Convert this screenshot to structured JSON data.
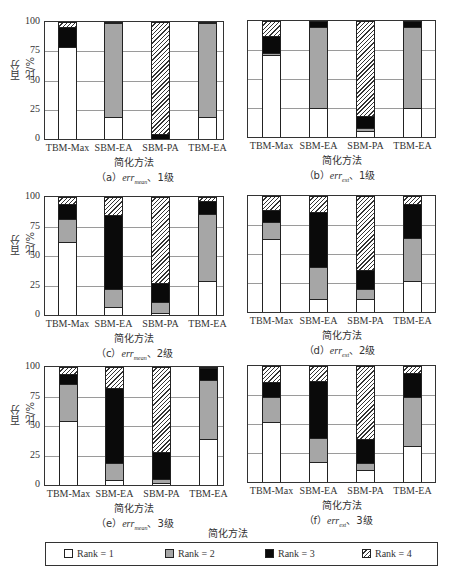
{
  "figure": {
    "y_axis_label": "百分比/%",
    "x_axis_label": "简化方法",
    "y_ticks": [
      "0",
      "25",
      "50",
      "75",
      "100"
    ],
    "categories": [
      "TBM-Max",
      "SBM-EA",
      "SBM-PA",
      "TBM-EA"
    ],
    "bottom_x_label": "简化方法"
  },
  "legend": {
    "items": [
      {
        "label": "Rank = 1",
        "color": "#ffffff"
      },
      {
        "label": "Rank = 2",
        "color": "#a6a6a6"
      },
      {
        "label": "Rank = 3",
        "color": "#0a0a0a"
      },
      {
        "label": "Rank = 4",
        "color": "hatched"
      }
    ]
  },
  "captions": {
    "a": {
      "prefix": "（a）",
      "var": "err",
      "sub": "mean",
      "suffix": "、1级"
    },
    "b": {
      "prefix": "（b）",
      "var": "err",
      "sub": "ext",
      "suffix": "、1级"
    },
    "c": {
      "prefix": "（c）",
      "var": "err",
      "sub": "mean",
      "suffix": "、2级"
    },
    "d": {
      "prefix": "（d）",
      "var": "err",
      "sub": "ext",
      "suffix": "、2级"
    },
    "e": {
      "prefix": "（e）",
      "var": "err",
      "sub": "mean",
      "suffix": "、3级"
    },
    "f": {
      "prefix": "（f）",
      "var": "err",
      "sub": "ext",
      "suffix": "、3级"
    }
  },
  "chart_data": [
    {
      "id": "a",
      "type": "bar",
      "stacked": true,
      "title": "(a) err_mean, 1级",
      "xlabel": "简化方法",
      "ylabel": "百分比/%",
      "ylim": [
        0,
        100
      ],
      "grid": true,
      "categories": [
        "TBM-Max",
        "SBM-EA",
        "SBM-PA",
        "TBM-EA"
      ],
      "series": [
        {
          "name": "Rank = 1",
          "values": [
            79,
            19,
            0,
            19
          ]
        },
        {
          "name": "Rank = 2",
          "values": [
            0,
            80,
            0,
            80
          ]
        },
        {
          "name": "Rank = 3",
          "values": [
            17,
            1,
            4,
            1
          ]
        },
        {
          "name": "Rank = 4",
          "values": [
            4,
            0,
            96,
            0
          ]
        }
      ]
    },
    {
      "id": "b",
      "type": "bar",
      "stacked": true,
      "title": "(b) err_ext, 1级",
      "xlabel": "简化方法",
      "ylabel": "百分比/%",
      "ylim": [
        0,
        100
      ],
      "grid": true,
      "categories": [
        "TBM-Max",
        "SBM-EA",
        "SBM-PA",
        "TBM-EA"
      ],
      "series": [
        {
          "name": "Rank = 1",
          "values": [
            71,
            25,
            5,
            25
          ]
        },
        {
          "name": "Rank = 2",
          "values": [
            1,
            70,
            3,
            70
          ]
        },
        {
          "name": "Rank = 3",
          "values": [
            15,
            5,
            10,
            5
          ]
        },
        {
          "name": "Rank = 4",
          "values": [
            13,
            0,
            82,
            0
          ]
        }
      ]
    },
    {
      "id": "c",
      "type": "bar",
      "stacked": true,
      "title": "(c) err_mean, 2级",
      "xlabel": "简化方法",
      "ylabel": "百分比/%",
      "ylim": [
        0,
        100
      ],
      "grid": true,
      "categories": [
        "TBM-Max",
        "SBM-EA",
        "SBM-PA",
        "TBM-EA"
      ],
      "series": [
        {
          "name": "Rank = 1",
          "values": [
            62,
            7,
            2,
            29
          ]
        },
        {
          "name": "Rank = 2",
          "values": [
            19,
            15,
            9,
            57
          ]
        },
        {
          "name": "Rank = 3",
          "values": [
            13,
            63,
            16,
            11
          ]
        },
        {
          "name": "Rank = 4",
          "values": [
            6,
            15,
            73,
            3
          ]
        }
      ]
    },
    {
      "id": "d",
      "type": "bar",
      "stacked": true,
      "title": "(d) err_ext, 2级",
      "xlabel": "简化方法",
      "ylabel": "百分比/%",
      "ylim": [
        0,
        100
      ],
      "grid": true,
      "categories": [
        "TBM-Max",
        "SBM-EA",
        "SBM-PA",
        "TBM-EA"
      ],
      "series": [
        {
          "name": "Rank = 1",
          "values": [
            63,
            11,
            11,
            27
          ]
        },
        {
          "name": "Rank = 2",
          "values": [
            15,
            28,
            9,
            37
          ]
        },
        {
          "name": "Rank = 3",
          "values": [
            10,
            47,
            16,
            29
          ]
        },
        {
          "name": "Rank = 4",
          "values": [
            12,
            14,
            64,
            7
          ]
        }
      ]
    },
    {
      "id": "e",
      "type": "bar",
      "stacked": true,
      "title": "(e) err_mean, 3级",
      "xlabel": "简化方法",
      "ylabel": "百分比/%",
      "ylim": [
        0,
        100
      ],
      "grid": true,
      "categories": [
        "TBM-Max",
        "SBM-EA",
        "SBM-PA",
        "TBM-EA"
      ],
      "series": [
        {
          "name": "Rank = 1",
          "values": [
            54,
            4,
            2,
            39
          ]
        },
        {
          "name": "Rank = 2",
          "values": [
            32,
            15,
            3,
            50
          ]
        },
        {
          "name": "Rank = 3",
          "values": [
            8,
            63,
            23,
            10
          ]
        },
        {
          "name": "Rank = 4",
          "values": [
            6,
            18,
            72,
            1
          ]
        }
      ]
    },
    {
      "id": "f",
      "type": "bar",
      "stacked": true,
      "title": "(f) err_ext, 3级",
      "xlabel": "简化方法",
      "ylabel": "百分比/%",
      "ylim": [
        0,
        100
      ],
      "grid": true,
      "categories": [
        "TBM-Max",
        "SBM-EA",
        "SBM-PA",
        "TBM-EA"
      ],
      "series": [
        {
          "name": "Rank = 1",
          "values": [
            52,
            17,
            10,
            31
          ]
        },
        {
          "name": "Rank = 2",
          "values": [
            21,
            21,
            6,
            42
          ]
        },
        {
          "name": "Rank = 3",
          "values": [
            13,
            49,
            21,
            21
          ]
        },
        {
          "name": "Rank = 4",
          "values": [
            14,
            13,
            63,
            6
          ]
        }
      ]
    }
  ],
  "layout": {
    "panels": [
      {
        "id": "a",
        "plot": [
          44,
          21,
          180,
          119
        ],
        "bars": [
          58,
          104,
          151,
          198
        ],
        "bar_w": 19,
        "yaxis": true,
        "xlabel_y": 152,
        "caption_y": 168,
        "caption_x": 118
      },
      {
        "id": "b",
        "plot": [
          247,
          20,
          189,
          118
        ],
        "bars": [
          262,
          309,
          356,
          403
        ],
        "bar_w": 19,
        "yaxis": false,
        "xlabel_y": 162,
        "caption_x": 331,
        "caption_y": 168,
        "xticks_y": 141
      },
      {
        "id": "c",
        "plot": [
          44,
          196,
          180,
          120
        ],
        "bars": [
          58,
          104,
          151,
          198
        ],
        "bar_w": 19,
        "yaxis": true,
        "xlabel_y": 329,
        "caption_y": 342,
        "caption_x": 108
      },
      {
        "id": "d",
        "plot": [
          247,
          195,
          189,
          118
        ],
        "bars": [
          262,
          309,
          356,
          403
        ],
        "bar_w": 19,
        "yaxis": false,
        "xlabel_y": 329,
        "caption_x": 316,
        "caption_y": 342
      },
      {
        "id": "e",
        "plot": [
          44,
          366,
          180,
          120
        ],
        "bars": [
          59,
          105,
          152,
          199
        ],
        "bar_w": 19,
        "yaxis": true,
        "xlabel_y": 499,
        "caption_y": 513,
        "caption_x": 118
      },
      {
        "id": "f",
        "plot": [
          247,
          365,
          189,
          118
        ],
        "bars": [
          262,
          309,
          356,
          403
        ],
        "bar_w": 19,
        "yaxis": false,
        "xlabel_y": 499,
        "caption_x": 318,
        "caption_y": 513
      }
    ]
  }
}
